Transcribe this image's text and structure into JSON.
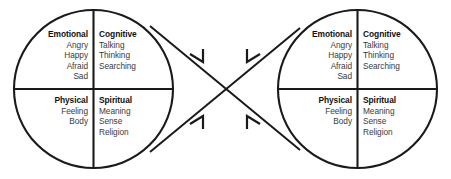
{
  "diagram": {
    "type": "two-circle-quadrant-model",
    "colors": {
      "stroke": "#1a1a1a",
      "background": "#ffffff",
      "title_text": "#101010",
      "item_text": "#3a3a3a"
    },
    "circles": [
      {
        "id": "left-circle",
        "quadrants": [
          {
            "id": "emotional",
            "position": "top-left",
            "title": "Emotional",
            "items": [
              "Angry",
              "Happy",
              "Afraid",
              "Sad"
            ]
          },
          {
            "id": "cognitive",
            "position": "top-right",
            "title": "Cognitive",
            "items": [
              "Talking",
              "Thinking",
              "Searching"
            ]
          },
          {
            "id": "physical",
            "position": "bottom-left",
            "title": "Physical",
            "items": [
              "Feeling",
              "Body"
            ]
          },
          {
            "id": "spiritual",
            "position": "bottom-right",
            "title": "Spiritual",
            "items": [
              "Meaning",
              "Sense",
              "Religion"
            ]
          }
        ]
      },
      {
        "id": "right-circle",
        "quadrants": [
          {
            "id": "emotional",
            "position": "top-left",
            "title": "Emotional",
            "items": [
              "Angry",
              "Happy",
              "Afraid",
              "Sad"
            ]
          },
          {
            "id": "cognitive",
            "position": "top-right",
            "title": "Cognitive",
            "items": [
              "Talking",
              "Thinking",
              "Searching"
            ]
          },
          {
            "id": "physical",
            "position": "bottom-left",
            "title": "Physical",
            "items": [
              "Feeling",
              "Body"
            ]
          },
          {
            "id": "spiritual",
            "position": "bottom-right",
            "title": "Spiritual",
            "items": [
              "Meaning",
              "Sense",
              "Religion"
            ]
          }
        ]
      }
    ],
    "connectors": [
      {
        "id": "left-top-to-right-bottom",
        "from": "left-circle-upper-right",
        "to": "right-circle-lower-left",
        "arrow": true
      },
      {
        "id": "left-bottom-to-right-top",
        "from": "left-circle-lower-right",
        "to": "right-circle-upper-left",
        "arrow": true
      },
      {
        "id": "right-top-to-left-bottom",
        "from": "right-circle-upper-left",
        "to": "left-circle-lower-right",
        "arrow": true
      },
      {
        "id": "right-bottom-to-left-top",
        "from": "right-circle-lower-left",
        "to": "left-circle-upper-right",
        "arrow": true
      }
    ]
  }
}
